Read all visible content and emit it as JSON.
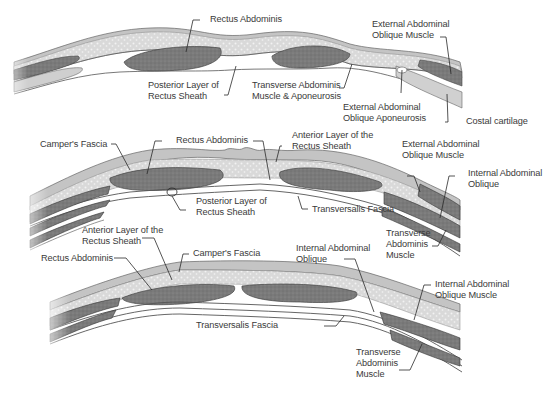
{
  "colors": {
    "skin": "#bdbdbd",
    "fat_speckle": "#dcdcdc",
    "muscle": "#7d7d7d",
    "fascia_line": "#555555",
    "white_space": "#ffffff",
    "label_text": "#3a3a3a"
  },
  "sections": [
    {
      "id": "upper",
      "labels": [
        {
          "key": "rectus_abdominis",
          "text": "Rectus Abdominis"
        },
        {
          "key": "ext_oblique_muscle",
          "text": "External Abdominal\nOblique Muscle"
        },
        {
          "key": "posterior_layer",
          "text": "Posterior Layer of\nRectus Sheath"
        },
        {
          "key": "transverse_aponeurosis",
          "text": "Transverse Abdominis\nMuscle & Aponeurosis"
        },
        {
          "key": "ext_oblique_aponeurosis",
          "text": "External Abdominal\nOblique Aponeurosis"
        },
        {
          "key": "costal_cartilage",
          "text": "Costal cartilage"
        }
      ]
    },
    {
      "id": "middle",
      "labels": [
        {
          "key": "campers_fascia",
          "text": "Camper's Fascia"
        },
        {
          "key": "rectus_abdominis",
          "text": "Rectus Abdominis"
        },
        {
          "key": "anterior_layer",
          "text": "Anterior Layer of the\nRectus Sheath"
        },
        {
          "key": "ext_oblique_muscle",
          "text": "External Abdominal\nOblique Muscle"
        },
        {
          "key": "int_oblique",
          "text": "Internal Abdominal\nOblique"
        },
        {
          "key": "posterior_layer",
          "text": "Posterior Layer of\nRectus Sheath"
        },
        {
          "key": "transversalis_fascia",
          "text": "Transversalis Fascia"
        },
        {
          "key": "transverse_muscle",
          "text": "Transverse\nAbdominis\nMuscle"
        }
      ]
    },
    {
      "id": "lower",
      "labels": [
        {
          "key": "anterior_layer",
          "text": "Anterior Layer of the\nRectus Sheath"
        },
        {
          "key": "campers_fascia",
          "text": "Camper's Fascia"
        },
        {
          "key": "rectus_abdominis",
          "text": "Rectus Abdominis"
        },
        {
          "key": "int_oblique",
          "text": "Internal Abdominal\nOblique"
        },
        {
          "key": "int_oblique_muscle",
          "text": "Internal Abdominal\nOblique Muscle"
        },
        {
          "key": "transversalis_fascia",
          "text": "Transversalis Fascia"
        },
        {
          "key": "transverse_muscle",
          "text": "Transverse\nAbdominis\nMuscle"
        }
      ]
    }
  ]
}
